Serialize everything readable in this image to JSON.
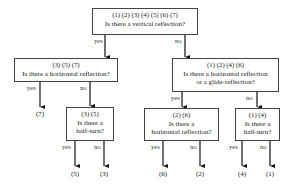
{
  "diagram": {
    "type": "decision-tree",
    "root": {
      "ids": "(1) (2) (3) (4) (5) (6) (7)",
      "question": "Is there a vertical reflection?",
      "yes_label": "yes",
      "no_label": "no"
    },
    "left": {
      "ids": "(3) (5) (7)",
      "question": "Is there a horizontal reflection?",
      "yes_label": "yes",
      "no_label": "no",
      "yes_leaf": "(7)"
    },
    "left_no": {
      "ids": "(3) (5)",
      "question_line1": "Is there a",
      "question_line2": "half-turn?",
      "yes_label": "yes",
      "no_label": "no",
      "yes_leaf": "(5)",
      "no_leaf": "(3)"
    },
    "right": {
      "ids": "(1) (2) (4) (6)",
      "question_line1": "Is there a horizontal reflection",
      "question_line2": "or a glide-reflection?",
      "yes_label": "yes",
      "no_label": "no"
    },
    "right_yes": {
      "ids": "(2) (6)",
      "question_line1": "Is there a",
      "question_line2": "horizontal reflection?",
      "yes_label": "yes",
      "no_label": "no",
      "yes_leaf": "(6)",
      "no_leaf": "(2)"
    },
    "right_no": {
      "ids": "(1) (4)",
      "question_line1": "Is there a",
      "question_line2": "half-turn?",
      "yes_label": "yes",
      "no_label": "no",
      "yes_leaf": "(4)",
      "no_leaf": "(1)"
    }
  }
}
